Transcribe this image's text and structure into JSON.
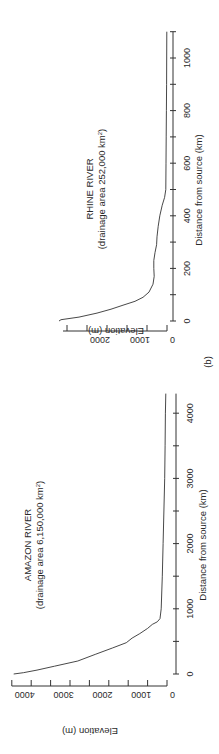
{
  "figure_label": "(b)",
  "chart_data": [
    {
      "type": "line",
      "title": "AMAZON RIVER",
      "subtitle": "(drainage area 6,150,000 km²)",
      "subtitle_parts": {
        "prefix": "(drainage area 6,150,000 km",
        "sup": "2",
        "suffix": ")"
      },
      "xlabel": "Distance from source (km)",
      "ylabel": "Elevation (m)",
      "xlim": [
        0,
        4300
      ],
      "ylim": [
        0,
        4000
      ],
      "xticks": [
        0,
        1000,
        2000,
        3000,
        4000
      ],
      "xminor": [
        500,
        1500,
        2500,
        3500
      ],
      "yticks": [
        0,
        1000,
        2000,
        3000,
        4000
      ],
      "yminor": [
        500,
        1500,
        2500,
        3500
      ],
      "grid": false,
      "orientation": "rotated 90° counter-clockwise",
      "x": [
        0,
        20,
        60,
        120,
        200,
        300,
        400,
        480,
        550,
        620,
        700,
        760,
        800,
        850,
        1000,
        1500,
        2000,
        2500,
        3000,
        3500,
        4000,
        4300
      ],
      "y": [
        3950,
        3700,
        3350,
        2900,
        2300,
        1850,
        1400,
        1050,
        900,
        700,
        500,
        380,
        250,
        180,
        150,
        120,
        100,
        80,
        60,
        50,
        40,
        30
      ]
    },
    {
      "type": "line",
      "title": "RHINE RIVER",
      "subtitle": "(drainage area 252,000 km²)",
      "subtitle_parts": {
        "prefix": "(drainage area 252,000 km",
        "sup": "2",
        "suffix": ")"
      },
      "xlabel": "Distance from source (km)",
      "ylabel": "Elevation (m)",
      "xlim": [
        0,
        1100
      ],
      "ylim": [
        0,
        2600
      ],
      "xticks": [
        0,
        200,
        400,
        600,
        800,
        1000
      ],
      "xminor": [
        100,
        300,
        500,
        700,
        900,
        1100
      ],
      "yticks": [
        0,
        1000,
        2000
      ],
      "yminor": [
        500,
        1500,
        2500
      ],
      "grid": false,
      "orientation": "rotated 90° counter-clockwise",
      "x": [
        0,
        5,
        15,
        30,
        45,
        60,
        75,
        90,
        110,
        140,
        170,
        200,
        230,
        260,
        290,
        320,
        360,
        400,
        440,
        470,
        500,
        600,
        700,
        800,
        900,
        1000,
        1100
      ],
      "y": [
        2700,
        2650,
        2200,
        1750,
        1400,
        1100,
        800,
        600,
        450,
        350,
        320,
        330,
        330,
        300,
        260,
        250,
        220,
        180,
        120,
        60,
        30,
        25,
        20,
        15,
        10,
        8,
        5
      ]
    }
  ]
}
